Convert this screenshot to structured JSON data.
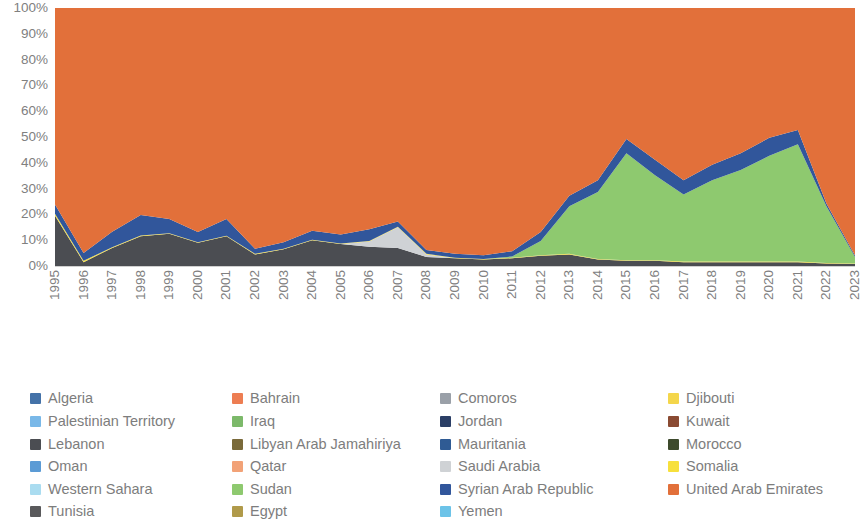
{
  "chart_data": {
    "type": "area",
    "stacked": true,
    "normalized_percent": true,
    "title": "",
    "xlabel": "",
    "ylabel": "",
    "ylim": [
      0,
      100
    ],
    "ytick_labels": [
      "100%",
      "90%",
      "80%",
      "70%",
      "60%",
      "50%",
      "40%",
      "30%",
      "20%",
      "10%",
      "0%"
    ],
    "ytick_values": [
      100,
      90,
      80,
      70,
      60,
      50,
      40,
      30,
      20,
      10,
      0
    ],
    "grid": false,
    "legend_position": "bottom",
    "categories": [
      "1995",
      "1996",
      "1997",
      "1998",
      "1999",
      "2000",
      "2001",
      "2002",
      "2003",
      "2004",
      "2005",
      "2006",
      "2007",
      "2008",
      "2009",
      "2010",
      "2011",
      "2012",
      "2013",
      "2014",
      "2015",
      "2016",
      "2017",
      "2018",
      "2019",
      "2020",
      "2021",
      "2022",
      "2023"
    ],
    "series": [
      {
        "name": "Algeria",
        "color": "#4472a8",
        "values": [
          0,
          0,
          0,
          0,
          0,
          0,
          0,
          0,
          0,
          0,
          0,
          0,
          0,
          0,
          0,
          0,
          0,
          0,
          0,
          0,
          0,
          0,
          0,
          0,
          0,
          0,
          0,
          0,
          0
        ]
      },
      {
        "name": "Bahrain",
        "color": "#ed7d52",
        "values": [
          0,
          0,
          0,
          0,
          0,
          0,
          0,
          0,
          0,
          0,
          0,
          0,
          0,
          0,
          0,
          0,
          0,
          0,
          0,
          0,
          0,
          0,
          0,
          0,
          0,
          0,
          0,
          0,
          0
        ]
      },
      {
        "name": "Comoros",
        "color": "#9aa0a8",
        "values": [
          0,
          0,
          0,
          0,
          0,
          0,
          0,
          0,
          0,
          0,
          0,
          0,
          0,
          0,
          0,
          0,
          0,
          0,
          0,
          0,
          0,
          0,
          0,
          0,
          0,
          0,
          0,
          0,
          0
        ]
      },
      {
        "name": "Djibouti",
        "color": "#f4d64b",
        "values": [
          0,
          0,
          0,
          0,
          0,
          0,
          0,
          0,
          0,
          0,
          0,
          0,
          0,
          0,
          0,
          0,
          0,
          0,
          0,
          0,
          0,
          0,
          0,
          0,
          0,
          0,
          0,
          0,
          0
        ]
      },
      {
        "name": "Palestinian Territory",
        "color": "#79b8e8",
        "values": [
          0,
          0,
          0,
          0,
          0,
          0,
          0,
          0,
          0,
          0,
          0,
          0,
          0,
          0,
          0,
          0,
          0,
          0,
          0,
          0,
          0,
          0,
          0,
          0,
          0,
          0,
          0,
          0,
          0
        ]
      },
      {
        "name": "Iraq",
        "color": "#7cb96a",
        "values": [
          0,
          0,
          0,
          0,
          0,
          0,
          0,
          0,
          0,
          0,
          0,
          0,
          0,
          0,
          0,
          0,
          0,
          0,
          0,
          0,
          0,
          0,
          0,
          0,
          0,
          0,
          0,
          0,
          0
        ]
      },
      {
        "name": "Jordan",
        "color": "#2b3f66",
        "values": [
          0,
          0,
          0,
          0,
          0,
          0,
          0,
          0,
          0,
          0,
          0,
          0,
          0,
          0,
          0,
          0,
          0,
          0,
          0,
          0,
          0,
          0,
          0,
          0,
          0,
          0,
          0,
          0,
          0
        ]
      },
      {
        "name": "Kuwait",
        "color": "#8a4a32",
        "values": [
          0,
          0,
          0,
          0,
          0,
          0,
          0,
          0,
          0,
          0,
          0,
          0,
          0,
          0,
          0,
          0,
          0,
          0,
          0,
          0,
          0,
          0,
          0,
          0,
          0,
          0,
          0,
          0,
          0
        ]
      },
      {
        "name": "Lebanon",
        "color": "#4b4d52",
        "values": [
          19.5,
          1.5,
          7.0,
          11.5,
          12.5,
          9.0,
          11.5,
          4.5,
          6.5,
          10.0,
          8.5,
          7.5,
          7.0,
          3.5,
          3.0,
          2.5,
          3.0,
          4.0,
          4.5,
          2.5,
          2.0,
          2.0,
          1.5,
          1.5,
          1.5,
          1.5,
          1.5,
          1.0,
          0.8
        ]
      },
      {
        "name": "Libyan Arab Jamahiriya",
        "color": "#7a6a3a",
        "values": [
          0,
          0,
          0,
          0,
          0,
          0,
          0,
          0,
          0,
          0,
          0,
          0,
          0,
          0,
          0,
          0,
          0,
          0,
          0,
          0,
          0,
          0,
          0,
          0,
          0,
          0,
          0,
          0,
          0
        ]
      },
      {
        "name": "Mauritania",
        "color": "#2f5b94",
        "values": [
          0,
          0,
          0,
          0,
          0,
          0,
          0,
          0,
          0,
          0,
          0,
          0,
          0,
          0,
          0,
          0,
          0,
          0,
          0,
          0,
          0,
          0,
          0,
          0,
          0,
          0,
          0,
          0,
          0
        ]
      },
      {
        "name": "Morocco",
        "color": "#3d4a2c",
        "values": [
          0,
          0,
          0,
          0,
          0,
          0,
          0,
          0,
          0,
          0,
          0,
          0,
          0,
          0,
          0,
          0,
          0,
          0,
          0,
          0,
          0,
          0,
          0,
          0,
          0,
          0,
          0,
          0,
          0
        ]
      },
      {
        "name": "Oman",
        "color": "#5b9bd5",
        "values": [
          0,
          0,
          0,
          0,
          0,
          0,
          0,
          0,
          0,
          0,
          0,
          0,
          0,
          0,
          0,
          0,
          0,
          0,
          0,
          0,
          0,
          0,
          0,
          0,
          0,
          0,
          0,
          0,
          0
        ]
      },
      {
        "name": "Qatar",
        "color": "#f2a277",
        "values": [
          0,
          0,
          0,
          0,
          0,
          0,
          0,
          0,
          0,
          0,
          0,
          0,
          0,
          0,
          0,
          0,
          0,
          0,
          0,
          0,
          0,
          0,
          0,
          0,
          0,
          0,
          0,
          0,
          0
        ]
      },
      {
        "name": "Saudi Arabia",
        "color": "#cfd2d5",
        "values": [
          0,
          0,
          0,
          0,
          0,
          0,
          0,
          0,
          0,
          0,
          0,
          2.0,
          8.0,
          1.0,
          0,
          0,
          0,
          0,
          0,
          0,
          0,
          0,
          0,
          0,
          0,
          0,
          0,
          0,
          0
        ]
      },
      {
        "name": "Somalia",
        "color": "#f7e03c",
        "values": [
          0.8,
          0.5,
          0.3,
          0.3,
          0.2,
          0.2,
          0.2,
          0.2,
          0.2,
          0.2,
          0.2,
          0.2,
          0.2,
          0.2,
          0.2,
          0.2,
          0.2,
          0.2,
          0.2,
          0.2,
          0.2,
          0.2,
          0.2,
          0.2,
          0.2,
          0.2,
          0.2,
          0.2,
          0.2
        ]
      },
      {
        "name": "Western Sahara",
        "color": "#aadcf0",
        "values": [
          0,
          0,
          0,
          0,
          0,
          0,
          0,
          0,
          0,
          0,
          0,
          0,
          0,
          0,
          0,
          0,
          0,
          0,
          0,
          0,
          0,
          0,
          0,
          0,
          0,
          0,
          0,
          0,
          0
        ]
      },
      {
        "name": "Sudan",
        "color": "#8ec96f",
        "values": [
          0,
          0,
          0,
          0,
          0,
          0,
          0,
          0,
          0,
          0,
          0,
          0,
          0,
          0,
          0,
          0,
          0.5,
          5.5,
          18.5,
          26.0,
          41.5,
          33.0,
          26.0,
          31.5,
          35.5,
          41.0,
          45.5,
          22.0,
          2.5
        ]
      },
      {
        "name": "Syrian Arab Republic",
        "color": "#31569b",
        "values": [
          3.5,
          3.0,
          6.0,
          8.0,
          5.5,
          4.0,
          6.5,
          2.0,
          2.5,
          3.5,
          3.5,
          4.5,
          2.0,
          1.5,
          1.5,
          1.5,
          2.0,
          3.5,
          4.0,
          4.5,
          5.5,
          6.0,
          5.5,
          6.0,
          6.5,
          7.0,
          5.5,
          1.0,
          0.6
        ]
      },
      {
        "name": "United Arab Emirates",
        "color": "#e2703a",
        "values": [
          76.2,
          95.0,
          86.7,
          80.2,
          81.8,
          86.8,
          81.8,
          93.3,
          90.8,
          86.3,
          87.8,
          85.8,
          82.8,
          93.8,
          95.3,
          95.8,
          94.3,
          86.8,
          72.8,
          66.8,
          50.8,
          58.8,
          66.8,
          60.8,
          56.3,
          50.3,
          47.3,
          75.8,
          95.9
        ]
      },
      {
        "name": "Tunisia",
        "color": "#59595b",
        "values": [
          0,
          0,
          0,
          0,
          0,
          0,
          0,
          0,
          0,
          0,
          0,
          0,
          0,
          0,
          0,
          0,
          0,
          0,
          0,
          0,
          0,
          0,
          0,
          0,
          0,
          0,
          0,
          0,
          0
        ]
      },
      {
        "name": "Egypt",
        "color": "#b09a4a",
        "values": [
          0,
          0,
          0,
          0,
          0,
          0,
          0,
          0,
          0,
          0,
          0,
          0,
          0,
          0,
          0,
          0,
          0,
          0,
          0,
          0,
          0,
          0,
          0,
          0,
          0,
          0,
          0,
          0,
          0
        ]
      },
      {
        "name": "Yemen",
        "color": "#6cc3e8",
        "values": [
          0,
          0,
          0,
          0,
          0,
          0,
          0,
          0,
          0,
          0,
          0,
          0,
          0,
          0,
          0,
          0,
          0,
          0,
          0,
          0,
          0,
          0,
          0,
          0,
          0,
          0,
          0,
          0,
          0
        ]
      }
    ]
  },
  "legend": {
    "items": [
      {
        "label": "Algeria",
        "color": "#4472a8"
      },
      {
        "label": "Bahrain",
        "color": "#ed7d52"
      },
      {
        "label": "Comoros",
        "color": "#9aa0a8"
      },
      {
        "label": "Djibouti",
        "color": "#f4d64b"
      },
      {
        "label": "Palestinian Territory",
        "color": "#79b8e8"
      },
      {
        "label": "Iraq",
        "color": "#7cb96a"
      },
      {
        "label": "Jordan",
        "color": "#2b3f66"
      },
      {
        "label": "Kuwait",
        "color": "#8a4a32"
      },
      {
        "label": "Lebanon",
        "color": "#4b4d52"
      },
      {
        "label": "Libyan Arab Jamahiriya",
        "color": "#7a6a3a"
      },
      {
        "label": "Mauritania",
        "color": "#2f5b94"
      },
      {
        "label": "Morocco",
        "color": "#3d4a2c"
      },
      {
        "label": "Oman",
        "color": "#5b9bd5"
      },
      {
        "label": "Qatar",
        "color": "#f2a277"
      },
      {
        "label": "Saudi Arabia",
        "color": "#cfd2d5"
      },
      {
        "label": "Somalia",
        "color": "#f7e03c"
      },
      {
        "label": "Western Sahara",
        "color": "#aadcf0"
      },
      {
        "label": "Sudan",
        "color": "#8ec96f"
      },
      {
        "label": "Syrian Arab Republic",
        "color": "#31569b"
      },
      {
        "label": "United Arab Emirates",
        "color": "#e2703a"
      },
      {
        "label": "Tunisia",
        "color": "#59595b"
      },
      {
        "label": "Egypt",
        "color": "#b09a4a"
      },
      {
        "label": "Yemen",
        "color": "#6cc3e8"
      }
    ]
  }
}
